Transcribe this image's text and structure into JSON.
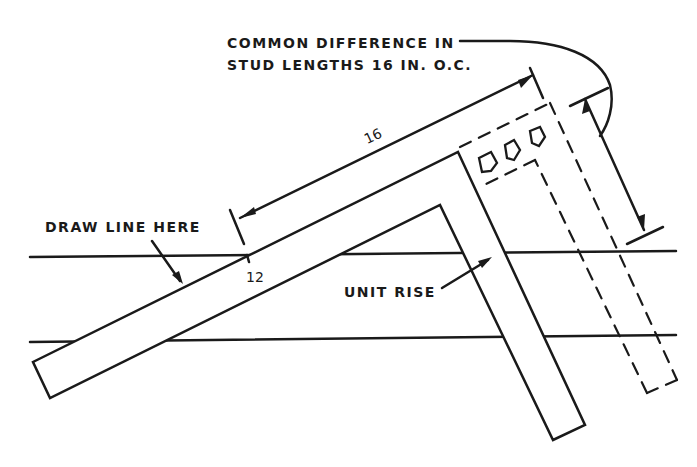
{
  "diagram": {
    "labels": {
      "common_difference_line1": "COMMON DIFFERENCE IN",
      "common_difference_line2": "STUD LENGTHS 16 IN. O.C.",
      "draw_line_here": "DRAW LINE HERE",
      "unit_rise": "UNIT RISE",
      "dim_16": "16",
      "dim_12": "12"
    },
    "colors": {
      "ink": "#1a1a1a",
      "background": "#ffffff"
    }
  }
}
